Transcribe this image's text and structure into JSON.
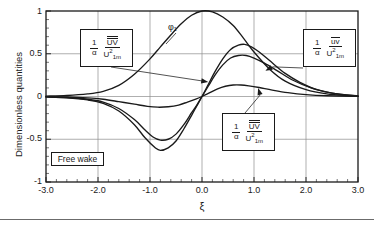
{
  "chart_data": {
    "type": "line",
    "title": "",
    "xlabel": "ξ",
    "ylabel": "Dimensionless quantities",
    "xlim": [
      -3.0,
      3.0
    ],
    "ylim": [
      -1.0,
      1.0
    ],
    "xticks": [
      "-3.0",
      "-2.0",
      "-1.0",
      "0.0",
      "1.0",
      "2.0",
      "3.0"
    ],
    "xtick_values": [
      -3.0,
      -2.0,
      -1.0,
      0.0,
      1.0,
      2.0,
      3.0
    ],
    "yticks": [
      "1",
      "0.5",
      "0",
      "-0.5",
      "-1"
    ],
    "ytick_values": [
      1.0,
      0.5,
      0.0,
      -0.5,
      -1.0
    ],
    "minor_xticks_per_interval": 5,
    "minor_yticks_per_interval": 5,
    "grid": true,
    "legend_position": "inline-callouts",
    "series": [
      {
        "name": "phi_1",
        "label": "φ₁",
        "points": [
          [
            -3.0,
            0.005
          ],
          [
            -2.6,
            0.012
          ],
          [
            -2.2,
            0.03
          ],
          [
            -1.9,
            0.06
          ],
          [
            -1.6,
            0.13
          ],
          [
            -1.3,
            0.26
          ],
          [
            -1.0,
            0.44
          ],
          [
            -0.8,
            0.58
          ],
          [
            -0.6,
            0.72
          ],
          [
            -0.4,
            0.85
          ],
          [
            -0.2,
            0.95
          ],
          [
            0.0,
            1.0
          ],
          [
            0.2,
            0.99
          ],
          [
            0.4,
            0.93
          ],
          [
            0.6,
            0.83
          ],
          [
            0.8,
            0.68
          ],
          [
            1.0,
            0.52
          ],
          [
            1.3,
            0.32
          ],
          [
            1.6,
            0.18
          ],
          [
            2.0,
            0.08
          ],
          [
            2.4,
            0.03
          ],
          [
            2.8,
            0.01
          ],
          [
            3.0,
            0.005
          ]
        ]
      },
      {
        "name": "curve_large_antisymmetric",
        "label": "1/α UV̅̅/U₁ₘ²",
        "points": [
          [
            -3.0,
            -0.005
          ],
          [
            -2.6,
            -0.015
          ],
          [
            -2.2,
            -0.04
          ],
          [
            -1.9,
            -0.08
          ],
          [
            -1.6,
            -0.17
          ],
          [
            -1.3,
            -0.33
          ],
          [
            -1.1,
            -0.48
          ],
          [
            -0.9,
            -0.6
          ],
          [
            -0.8,
            -0.63
          ],
          [
            -0.65,
            -0.6
          ],
          [
            -0.5,
            -0.52
          ],
          [
            -0.35,
            -0.38
          ],
          [
            -0.2,
            -0.22
          ],
          [
            -0.1,
            -0.11
          ],
          [
            0.0,
            0.0
          ],
          [
            0.12,
            0.14
          ],
          [
            0.25,
            0.29
          ],
          [
            0.4,
            0.44
          ],
          [
            0.55,
            0.55
          ],
          [
            0.7,
            0.6
          ],
          [
            0.82,
            0.61
          ],
          [
            0.95,
            0.58
          ],
          [
            1.1,
            0.52
          ],
          [
            1.3,
            0.42
          ],
          [
            1.6,
            0.27
          ],
          [
            1.9,
            0.16
          ],
          [
            2.2,
            0.08
          ],
          [
            2.6,
            0.03
          ],
          [
            3.0,
            0.005
          ]
        ]
      },
      {
        "name": "curve_medium_antisymmetric",
        "label": "1/α u̅v̅/U₁ₘ²",
        "points": [
          [
            -3.0,
            -0.004
          ],
          [
            -2.6,
            -0.012
          ],
          [
            -2.2,
            -0.032
          ],
          [
            -1.9,
            -0.065
          ],
          [
            -1.6,
            -0.14
          ],
          [
            -1.3,
            -0.27
          ],
          [
            -1.1,
            -0.39
          ],
          [
            -0.95,
            -0.47
          ],
          [
            -0.8,
            -0.51
          ],
          [
            -0.65,
            -0.5
          ],
          [
            -0.5,
            -0.44
          ],
          [
            -0.35,
            -0.33
          ],
          [
            -0.2,
            -0.19
          ],
          [
            -0.1,
            -0.1
          ],
          [
            0.0,
            0.0
          ],
          [
            0.12,
            0.12
          ],
          [
            0.25,
            0.25
          ],
          [
            0.4,
            0.37
          ],
          [
            0.55,
            0.45
          ],
          [
            0.7,
            0.48
          ],
          [
            0.85,
            0.48
          ],
          [
            1.0,
            0.45
          ],
          [
            1.2,
            0.39
          ],
          [
            1.45,
            0.3
          ],
          [
            1.75,
            0.19
          ],
          [
            2.1,
            0.1
          ],
          [
            2.5,
            0.04
          ],
          [
            3.0,
            0.005
          ]
        ]
      },
      {
        "name": "curve_small_antisymmetric",
        "label": "1/α UV̅̅/U₁ₘ²",
        "points": [
          [
            -3.0,
            -0.002
          ],
          [
            -2.6,
            -0.006
          ],
          [
            -2.2,
            -0.016
          ],
          [
            -1.9,
            -0.032
          ],
          [
            -1.6,
            -0.06
          ],
          [
            -1.3,
            -0.09
          ],
          [
            -1.05,
            -0.115
          ],
          [
            -0.85,
            -0.125
          ],
          [
            -0.65,
            -0.12
          ],
          [
            -0.45,
            -0.1
          ],
          [
            -0.28,
            -0.065
          ],
          [
            -0.12,
            -0.03
          ],
          [
            0.0,
            0.0
          ],
          [
            0.15,
            0.045
          ],
          [
            0.3,
            0.09
          ],
          [
            0.45,
            0.12
          ],
          [
            0.6,
            0.135
          ],
          [
            0.75,
            0.135
          ],
          [
            0.9,
            0.125
          ],
          [
            1.1,
            0.105
          ],
          [
            1.35,
            0.075
          ],
          [
            1.65,
            0.045
          ],
          [
            2.0,
            0.022
          ],
          [
            2.4,
            0.009
          ],
          [
            3.0,
            0.002
          ]
        ]
      }
    ],
    "annotations": [
      {
        "name": "callout-left",
        "coef_num": "1",
        "coef_den": "α",
        "frac_num": "UV",
        "frac_num_overline": "double",
        "frac_den": "U",
        "frac_den_sub": "1m",
        "frac_den_sup": "2",
        "arrow_to": [
          0.12,
          0.17
        ]
      },
      {
        "name": "callout-right",
        "coef_num": "1",
        "coef_den": "α",
        "frac_num": "uv",
        "frac_num_overline": "single",
        "frac_den": "U",
        "frac_den_sub": "1m",
        "frac_den_sup": "2",
        "arrow_to": [
          1.22,
          0.3
        ]
      },
      {
        "name": "callout-bottom",
        "coef_num": "1",
        "coef_den": "α",
        "frac_num": "UV",
        "frac_num_overline": "double",
        "frac_den": "U",
        "frac_den_sub": "1m",
        "frac_den_sup": "2",
        "arrow_to": [
          1.08,
          0.1
        ]
      },
      {
        "name": "free-wake-box",
        "text": "Free wake"
      },
      {
        "name": "phi-label",
        "text": "φ₁"
      }
    ]
  },
  "axes": {
    "ylabel": "Dimensionless quantities",
    "xlabel": "ξ",
    "yticks": [
      "1",
      "0.5",
      "0",
      "-0.5",
      "-1"
    ],
    "xticks": [
      "-3.0",
      "-2.0",
      "-1.0",
      "0.0",
      "1.0",
      "2.0",
      "3.0"
    ]
  },
  "labels": {
    "free_wake": "Free wake",
    "phi1": "φ₁",
    "one": "1",
    "alpha": "α",
    "uv_upper": "UV",
    "uv_lower": "uv",
    "u_base": "U",
    "u_sub": "1m",
    "u_sup": "2"
  },
  "colors": {
    "background": "#ffffff",
    "ink": "#1a1a1a",
    "grid": "#8c8c8c",
    "rule": "#6b6b6b"
  }
}
